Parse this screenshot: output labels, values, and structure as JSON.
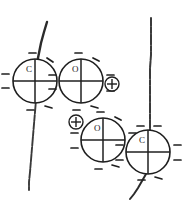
{
  "figure": {
    "background_color": "#ffffff",
    "ink_color": "#1f1f1f",
    "width": 184,
    "height": 209
  },
  "atoms": [
    {
      "id": "atom-c-top-left",
      "element": "C",
      "cx": 35,
      "cy": 81,
      "r": 22,
      "lone_pair_count": 8,
      "has_cross": true
    },
    {
      "id": "atom-o-top-middle",
      "element": "O",
      "cx": 81,
      "cy": 81,
      "r": 22,
      "lone_pair_count": 8,
      "has_cross": true
    },
    {
      "id": "atom-o-bottom-middle",
      "element": "O",
      "cx": 103,
      "cy": 140,
      "r": 22,
      "lone_pair_count": 8,
      "has_cross": true
    },
    {
      "id": "atom-c-bottom-right",
      "element": "C",
      "cx": 148,
      "cy": 152,
      "r": 22,
      "lone_pair_count": 8,
      "has_cross": true
    }
  ],
  "charges": [
    {
      "id": "charge-top-right",
      "symbol": "+",
      "cx": 112,
      "cy": 84,
      "r": 7
    },
    {
      "id": "charge-bottom-left",
      "symbol": "+",
      "cx": 76,
      "cy": 122,
      "r": 7
    }
  ],
  "bond_lines": [
    {
      "id": "bond-line-left",
      "description": "sketchy line descending through the top-left carbon"
    },
    {
      "id": "bond-line-right",
      "description": "sketchy line descending through the bottom-right carbon"
    }
  ]
}
